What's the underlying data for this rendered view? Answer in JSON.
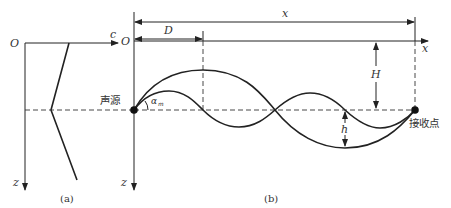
{
  "panel_a": {
    "origin_label": "O",
    "x_axis_label": "c",
    "y_axis_label": "z",
    "caption": "(a)",
    "profile_points": [
      [
        69,
        43
      ],
      [
        51,
        110
      ],
      [
        77,
        180
      ]
    ]
  },
  "panel_b": {
    "origin_label": "O",
    "x_axis_label": "x",
    "y_axis_label": "z",
    "range_label": "x",
    "D_label": "D",
    "H_label": "H",
    "h_label": "h",
    "angle_label": "α",
    "angle_subscript": "m",
    "source_label": "声源",
    "receiver_label": "接收点",
    "caption": "(b)"
  },
  "colors": {
    "line": "#222222",
    "background": "#ffffff"
  }
}
